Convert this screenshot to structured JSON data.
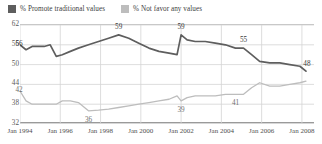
{
  "legend": {
    "items": [
      {
        "label": "% Promote traditional values",
        "color": "#5e5e5e",
        "icon": "square-swatch"
      },
      {
        "label": "% Not favor any values",
        "color": "#bdbdbd",
        "icon": "square-swatch"
      }
    ]
  },
  "chart_data": {
    "type": "line",
    "title": "",
    "subtitle": "",
    "xlabel": "",
    "ylabel": "",
    "grid": true,
    "legend_position": "top-left",
    "ylim": [
      32,
      62
    ],
    "yticks": [
      62,
      56,
      50,
      44,
      38,
      32
    ],
    "ytick_labels": [
      "62",
      "56",
      "50",
      "44",
      "38",
      "32"
    ],
    "xticks": [
      "Jan 1994",
      "Jan 1996",
      "Jan 1998",
      "Jan 2000",
      "Jan 2002",
      "Jan 2004",
      "Jan 2006",
      "Jan 2008"
    ],
    "x": [
      1994.0,
      1994.3,
      1994.6,
      1994.9,
      1995.2,
      1995.5,
      1995.8,
      1996.1,
      1996.5,
      1996.9,
      1997.4,
      1997.9,
      1998.4,
      1998.9,
      1999.4,
      1999.9,
      2000.4,
      2000.9,
      2001.4,
      2001.8,
      2002.0,
      2002.3,
      2002.7,
      2003.2,
      2003.7,
      2004.2,
      2004.7,
      2005.1,
      2005.5,
      2005.9,
      2006.4,
      2006.9,
      2007.4,
      2007.9,
      2008.2
    ],
    "series": [
      {
        "name": "% Promote traditional values",
        "color": "#5e5e5e",
        "values": [
          56,
          54.5,
          55.5,
          55.5,
          55.5,
          56,
          52.5,
          53,
          54,
          55,
          56,
          57,
          58,
          59,
          58,
          56.5,
          55,
          54,
          53.5,
          53,
          59,
          57.5,
          57,
          57,
          56.5,
          56,
          55,
          55,
          53,
          51,
          50.5,
          50.5,
          50,
          49.5,
          48
        ],
        "labels": [
          {
            "x_index": 0,
            "value": 56,
            "text": "56"
          },
          {
            "x_index": 13,
            "value": 59,
            "text": "59"
          },
          {
            "x_index": 20,
            "value": 59,
            "text": "59"
          },
          {
            "x_index": 27,
            "value": 55,
            "text": "55"
          },
          {
            "x_index": 34,
            "value": 48,
            "text": "48"
          }
        ]
      },
      {
        "name": "% Not favor any values",
        "color": "#bdbdbd",
        "values": [
          42,
          39,
          38,
          38,
          38,
          38,
          38,
          39,
          39,
          38.5,
          36,
          36.2,
          36.5,
          37,
          37.5,
          38,
          38.5,
          39,
          39.5,
          40.5,
          39,
          40,
          40.5,
          40.5,
          40.5,
          41,
          41,
          41,
          43,
          44.5,
          43.5,
          43.5,
          44,
          44.5,
          45
        ],
        "labels": [
          {
            "x_index": 0,
            "value": 42,
            "text": "42"
          },
          {
            "x_index": 10,
            "value": 36,
            "text": "36"
          },
          {
            "x_index": 20,
            "value": 39,
            "text": "39"
          },
          {
            "x_index": 26,
            "value": 41,
            "text": "41"
          }
        ]
      }
    ]
  }
}
